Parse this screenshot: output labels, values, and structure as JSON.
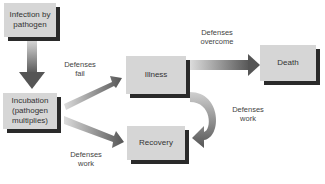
{
  "diagram": {
    "nodes": {
      "infection": "Infection by pathogen",
      "incubation": "Incubation (pathogen multiplies)",
      "illness": "Illness",
      "recovery": "Recovery",
      "death": "Death"
    },
    "edges": [
      {
        "from": "infection",
        "to": "incubation",
        "label": ""
      },
      {
        "from": "incubation",
        "to": "illness",
        "label": "Defenses fail"
      },
      {
        "from": "incubation",
        "to": "recovery",
        "label": "Defenses work"
      },
      {
        "from": "illness",
        "to": "death",
        "label": "Defenses overcome"
      },
      {
        "from": "illness",
        "to": "recovery",
        "label": "Defenses work"
      }
    ],
    "labels": {
      "defenses_fail_1": "Defenses",
      "defenses_fail_2": "fail",
      "defenses_work_a1": "Defenses",
      "defenses_work_a2": "work",
      "defenses_overcome_1": "Defenses",
      "defenses_overcome_2": "overcome",
      "defenses_work_b1": "Defenses",
      "defenses_work_b2": "work"
    },
    "node_lines": {
      "infection_1": "Infection by",
      "infection_2": "pathogen",
      "incubation_1": "Incubation",
      "incubation_2": "(pathogen",
      "incubation_3": "multiplies)"
    },
    "colors": {
      "box_fill": "#d6d6d6",
      "box_shadow": "#2a2a2a",
      "arrow_dark": "#555555",
      "arrow_light": "#d8d8d8"
    }
  }
}
